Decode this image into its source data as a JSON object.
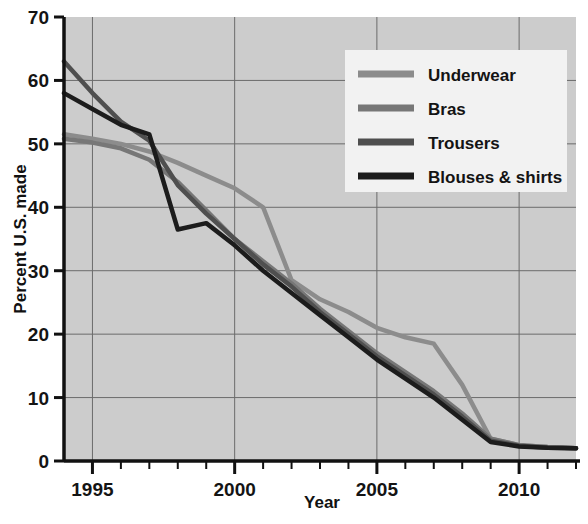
{
  "chart_data": {
    "type": "line",
    "title": "",
    "xlabel": "Year",
    "ylabel": "Percent U.S. made",
    "xlim": [
      1994,
      2012
    ],
    "ylim": [
      0,
      70
    ],
    "ytick_step": 10,
    "yticks": [
      0,
      10,
      20,
      30,
      40,
      50,
      60,
      70
    ],
    "ytick_labels": [
      "0",
      "10",
      "20",
      "30",
      "40",
      "50",
      "60",
      "70"
    ],
    "xticks_major": [
      1995,
      2000,
      2005,
      2010
    ],
    "xtick_labels": [
      "1995",
      "2000",
      "2005",
      "2010"
    ],
    "xticks_minor_step": 1,
    "grid": true,
    "grid_x_values": [
      1995,
      2000,
      2005,
      2010
    ],
    "grid_y_values": [
      10,
      20,
      30,
      40,
      50,
      60
    ],
    "legend_position": "top-right",
    "plot_background": "#cccccc",
    "x": [
      1994,
      1995,
      1996,
      1997,
      1998,
      1999,
      2000,
      2001,
      2002,
      2003,
      2004,
      2005,
      2006,
      2007,
      2008,
      2009,
      2010,
      2011,
      2012
    ],
    "series": [
      {
        "name": "Underwear",
        "color": "#8c8c8c",
        "values": [
          51.5,
          50.8,
          50.0,
          48.8,
          47.0,
          45.0,
          43.0,
          40.0,
          28.5,
          25.5,
          23.5,
          21.0,
          19.5,
          18.5,
          12.0,
          3.5,
          2.5,
          2.2,
          2.0
        ]
      },
      {
        "name": "Bras",
        "color": "#777777",
        "values": [
          50.8,
          50.2,
          49.3,
          47.5,
          44.0,
          39.5,
          35.0,
          31.5,
          28.0,
          24.0,
          20.5,
          17.0,
          14.0,
          11.0,
          7.5,
          3.5,
          2.5,
          2.2,
          2.0
        ]
      },
      {
        "name": "Trousers",
        "color": "#4f4f4f",
        "values": [
          63.0,
          58.0,
          53.5,
          50.5,
          43.5,
          39.0,
          35.0,
          31.0,
          27.5,
          23.5,
          20.0,
          16.5,
          13.5,
          10.5,
          7.0,
          3.2,
          2.4,
          2.1,
          2.0
        ]
      },
      {
        "name": "Blouses & shirts",
        "color": "#1c1c1c",
        "values": [
          58.0,
          55.5,
          53.0,
          51.5,
          36.5,
          37.5,
          34.0,
          30.0,
          26.5,
          23.0,
          19.5,
          16.0,
          13.0,
          10.0,
          6.5,
          3.0,
          2.3,
          2.1,
          2.0
        ]
      }
    ]
  }
}
